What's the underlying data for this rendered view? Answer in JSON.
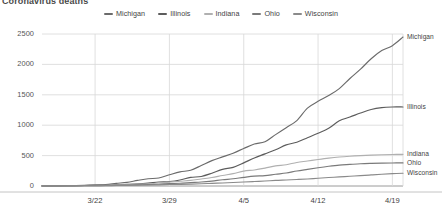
{
  "title": "Coronavirus deaths",
  "legend": {
    "position": "top-center",
    "items": [
      {
        "label": "Michigan",
        "color": "#6b6b6b"
      },
      {
        "label": "Illinois",
        "color": "#5c5c5c"
      },
      {
        "label": "Indiana",
        "color": "#b0b0b0"
      },
      {
        "label": "Ohio",
        "color": "#7a7a7a"
      },
      {
        "label": "Wisconsin",
        "color": "#8a8a8a"
      }
    ]
  },
  "axes": {
    "y_ticks": [
      "0",
      "500",
      "1000",
      "1500",
      "2000",
      "2500"
    ],
    "x_ticks": [
      "3/22",
      "3/29",
      "4/5",
      "4/12",
      "4/19"
    ]
  },
  "end_labels": [
    {
      "label": "Michigan"
    },
    {
      "label": "Illinois"
    },
    {
      "label": "Indiana"
    },
    {
      "label": "Ohio"
    },
    {
      "label": "Wisconsin"
    }
  ],
  "chart_data": {
    "type": "line",
    "title": "Coronavirus deaths",
    "xlabel": "",
    "ylabel": "",
    "ylim": [
      0,
      2500
    ],
    "grid": true,
    "legend_position": "top-center",
    "x": [
      "3/17",
      "3/18",
      "3/19",
      "3/20",
      "3/21",
      "3/22",
      "3/23",
      "3/24",
      "3/25",
      "3/26",
      "3/27",
      "3/28",
      "3/29",
      "3/30",
      "3/31",
      "4/1",
      "4/2",
      "4/3",
      "4/4",
      "4/5",
      "4/6",
      "4/7",
      "4/8",
      "4/9",
      "4/10",
      "4/11",
      "4/12",
      "4/13",
      "4/14",
      "4/15",
      "4/16",
      "4/17",
      "4/18",
      "4/19",
      "4/20"
    ],
    "x_tick_labels": [
      "3/22",
      "3/29",
      "4/5",
      "4/12",
      "4/19"
    ],
    "series": [
      {
        "name": "Michigan",
        "color": "#6b6b6b",
        "end_value": 2450,
        "values": [
          2,
          3,
          5,
          8,
          12,
          19,
          24,
          43,
          60,
          92,
          120,
          132,
          184,
          232,
          259,
          337,
          417,
          479,
          540,
          617,
          690,
          727,
          845,
          959,
          1076,
          1281,
          1392,
          1487,
          1602,
          1768,
          1921,
          2093,
          2227,
          2308,
          2450
        ]
      },
      {
        "name": "Illinois",
        "color": "#5c5c5c",
        "end_value": 1300,
        "values": [
          1,
          2,
          4,
          5,
          9,
          11,
          16,
          19,
          26,
          34,
          47,
          65,
          73,
          99,
          141,
          157,
          210,
          274,
          307,
          380,
          462,
          528,
          596,
          677,
          720,
          794,
          868,
          948,
          1072,
          1134,
          1200,
          1259,
          1290,
          1300,
          1300
        ]
      },
      {
        "name": "Indiana",
        "color": "#b0b0b0",
        "end_value": 520,
        "values": [
          2,
          3,
          4,
          6,
          8,
          10,
          13,
          17,
          24,
          31,
          35,
          49,
          65,
          78,
          92,
          116,
          139,
          173,
          203,
          245,
          264,
          294,
          330,
          350,
          387,
          411,
          436,
          459,
          477,
          490,
          500,
          508,
          514,
          518,
          520
        ]
      },
      {
        "name": "Ohio",
        "color": "#7a7a7a",
        "end_value": 380,
        "values": [
          1,
          1,
          3,
          3,
          5,
          6,
          8,
          10,
          15,
          19,
          23,
          29,
          39,
          45,
          55,
          65,
          81,
          102,
          119,
          142,
          162,
          170,
          193,
          213,
          247,
          274,
          300,
          324,
          344,
          355,
          366,
          372,
          376,
          379,
          380
        ]
      },
      {
        "name": "Wisconsin",
        "color": "#8a8a8a",
        "end_value": 210,
        "values": [
          1,
          1,
          2,
          3,
          4,
          5,
          6,
          8,
          10,
          13,
          16,
          19,
          24,
          27,
          31,
          37,
          44,
          50,
          57,
          65,
          74,
          82,
          92,
          99,
          107,
          116,
          128,
          139,
          149,
          160,
          170,
          182,
          194,
          203,
          210
        ]
      }
    ]
  }
}
